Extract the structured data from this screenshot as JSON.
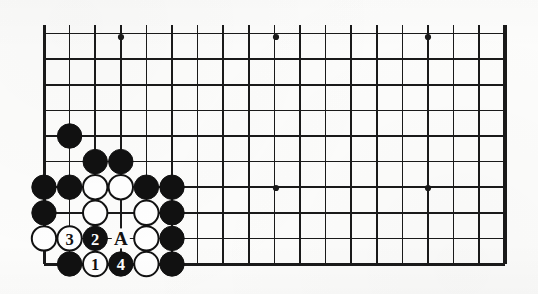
{
  "figure": {
    "kind": "go-board-diagram",
    "board_size": 19,
    "visible_columns": 19,
    "visible_rows": 10,
    "orientation": "bottom-left corner",
    "background_color": "#fdfdfc",
    "line_color": "#1a1a1a",
    "black_stone_color": "#111111",
    "white_stone_color": "#ffffff",
    "white_stone_outline_color": "#111111"
  },
  "geometry": {
    "origin_x": 44,
    "origin_y": 37,
    "cell_size": 25.6,
    "stone_radius": 12.2,
    "left_edge_x": 44,
    "right_edge_x": 505,
    "top_edge_y": 37,
    "bottom_edge_y": 264
  },
  "star_points": [
    {
      "name": "hoshi-top-left",
      "col": 4,
      "row": 10,
      "x": 121,
      "y": 37
    },
    {
      "name": "hoshi-top-center",
      "col": 10,
      "row": 10,
      "x": 276,
      "y": 37
    },
    {
      "name": "hoshi-top-right",
      "col": 16,
      "row": 10,
      "x": 428,
      "y": 37
    },
    {
      "name": "hoshi-bottom-center",
      "col": 10,
      "row": 4,
      "x": 276,
      "y": 188
    },
    {
      "name": "hoshi-bottom-right",
      "col": 16,
      "row": 4,
      "x": 428,
      "y": 188
    }
  ],
  "stones": [
    {
      "id": "b1",
      "color": "black",
      "col": 2,
      "row": 6,
      "label": ""
    },
    {
      "id": "b2",
      "color": "black",
      "col": 3,
      "row": 5,
      "label": ""
    },
    {
      "id": "b3",
      "color": "black",
      "col": 4,
      "row": 5,
      "label": ""
    },
    {
      "id": "b4",
      "color": "black",
      "col": 1,
      "row": 4,
      "label": ""
    },
    {
      "id": "b5",
      "color": "black",
      "col": 2,
      "row": 4,
      "label": ""
    },
    {
      "id": "w1",
      "color": "white",
      "col": 3,
      "row": 4,
      "label": ""
    },
    {
      "id": "w2",
      "color": "white",
      "col": 4,
      "row": 4,
      "label": ""
    },
    {
      "id": "b6",
      "color": "black",
      "col": 5,
      "row": 4,
      "label": ""
    },
    {
      "id": "b7",
      "color": "black",
      "col": 6,
      "row": 4,
      "label": ""
    },
    {
      "id": "b8",
      "color": "black",
      "col": 1,
      "row": 3,
      "label": ""
    },
    {
      "id": "w3",
      "color": "white",
      "col": 3,
      "row": 3,
      "label": ""
    },
    {
      "id": "w4",
      "color": "white",
      "col": 5,
      "row": 3,
      "label": ""
    },
    {
      "id": "b9",
      "color": "black",
      "col": 6,
      "row": 3,
      "label": ""
    },
    {
      "id": "w5",
      "color": "white",
      "col": 1,
      "row": 2,
      "label": ""
    },
    {
      "id": "move3",
      "color": "white",
      "col": 2,
      "row": 2,
      "label": "3"
    },
    {
      "id": "move2",
      "color": "black",
      "col": 3,
      "row": 2,
      "label": "2"
    },
    {
      "id": "w6",
      "color": "white",
      "col": 5,
      "row": 2,
      "label": ""
    },
    {
      "id": "b10",
      "color": "black",
      "col": 6,
      "row": 2,
      "label": ""
    },
    {
      "id": "b11",
      "color": "black",
      "col": 2,
      "row": 1,
      "label": ""
    },
    {
      "id": "move1",
      "color": "white",
      "col": 3,
      "row": 1,
      "label": "1"
    },
    {
      "id": "move4",
      "color": "black",
      "col": 4,
      "row": 1,
      "label": "4"
    },
    {
      "id": "w7",
      "color": "white",
      "col": 5,
      "row": 1,
      "label": ""
    },
    {
      "id": "b12",
      "color": "black",
      "col": 6,
      "row": 1,
      "label": ""
    }
  ],
  "point_markers": [
    {
      "id": "marker-a",
      "text": "A",
      "col": 4,
      "row": 2
    }
  ],
  "move_sequence": [
    {
      "number": "1",
      "color": "white",
      "stone_id": "move1"
    },
    {
      "number": "2",
      "color": "black",
      "stone_id": "move2"
    },
    {
      "number": "3",
      "color": "white",
      "stone_id": "move3"
    },
    {
      "number": "4",
      "color": "black",
      "stone_id": "move4"
    }
  ]
}
